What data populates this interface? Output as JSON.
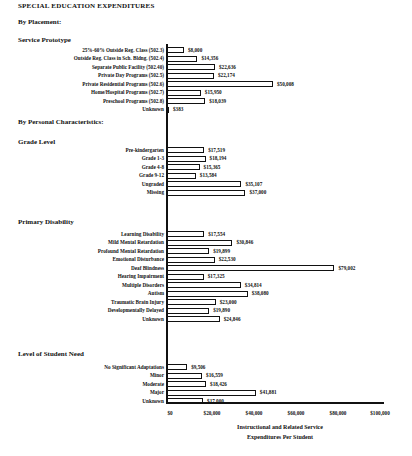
{
  "title": "SPECIAL EDUCATION EXPENDITURES",
  "sections": {
    "by_placement": "By Placement:",
    "by_personal": "By Personal Characteristics:"
  },
  "groups": {
    "service_prototype": "Service Prototype",
    "grade_level": "Grade Level",
    "primary_disability": "Primary Disability",
    "level_of_need": "Level of Student Need"
  },
  "chart_data": {
    "type": "bar",
    "orientation": "horizontal",
    "title": "SPECIAL EDUCATION EXPENDITURES",
    "xlabel": "Instructional and Related Service Expenditures Per Student",
    "ylabel": "",
    "xlim": [
      0,
      100000
    ],
    "xticks": [
      "$0",
      "$20,000",
      "$40,000",
      "$60,000",
      "$80,000",
      "$100,000"
    ],
    "grid": false,
    "legend": null,
    "groups": [
      {
        "section": "By Placement:",
        "name": "Service Prototype",
        "categories": [
          "25%-60% Outside Reg. Class (502.3)",
          "Outside Reg. Class in Sch. Bldng. (502.4)",
          "Separate Public Facility (502.40)",
          "Private Day Programs (502.5)",
          "Private Residential Programs (502.6)",
          "Home/Hospital Programs (502.7)",
          "Preschool Programs (502.8)",
          "Unknown"
        ],
        "values": [
          8000,
          14356,
          22636,
          22174,
          50008,
          15950,
          18039,
          383
        ],
        "labels": [
          "$8,000",
          "$14,356",
          "$22,636",
          "$22,174",
          "$50,008",
          "$15,950",
          "$18,039",
          "$383"
        ]
      },
      {
        "section": "By Personal Characteristics:",
        "name": "Grade Level",
        "categories": [
          "Pre-kindergarten",
          "Grade 1-3",
          "Grade 4-8",
          "Grade 9-12",
          "Ungraded",
          "Missing"
        ],
        "values": [
          17519,
          18194,
          15365,
          13584,
          35107,
          37000
        ],
        "labels": [
          "$17,519",
          "$18,194",
          "$15,365",
          "$13,584",
          "$35,107",
          "$37,000"
        ]
      },
      {
        "name": "Primary Disability",
        "categories": [
          "Learning Disability",
          "Mild Mental Retardation",
          "Profound Mental Retardation",
          "Emotional Disturbance",
          "Deaf Blindness",
          "Hearing Impairment",
          "Multiple Disorders",
          "Autism",
          "Traumatic Brain Injury",
          "Developmentally Delayed",
          "Unknown"
        ],
        "values": [
          17554,
          30846,
          19899,
          22530,
          79002,
          17325,
          34814,
          38080,
          23000,
          19890,
          24846
        ],
        "labels": [
          "$17,554",
          "$30,846",
          "$19,899",
          "$22,530",
          "$79,002",
          "$17,325",
          "$34,814",
          "$38,080",
          "$23,000",
          "$19,890",
          "$24,846"
        ]
      },
      {
        "name": "Level of Student Need",
        "categories": [
          "No Significant Adaptations",
          "Minor",
          "Moderate",
          "Major",
          "Unknown"
        ],
        "values": [
          9506,
          16559,
          18426,
          41881,
          17000
        ],
        "labels": [
          "$9,506",
          "$16,559",
          "$18,426",
          "$41,881",
          "$17,000"
        ]
      }
    ]
  },
  "axis": {
    "ticks": [
      "$0",
      "$20,000",
      "$40,000",
      "$60,000",
      "$80,000",
      "$100,000"
    ],
    "xlabel_line1": "Instructional and Related Service",
    "xlabel_line2": "Expenditures Per Student"
  }
}
